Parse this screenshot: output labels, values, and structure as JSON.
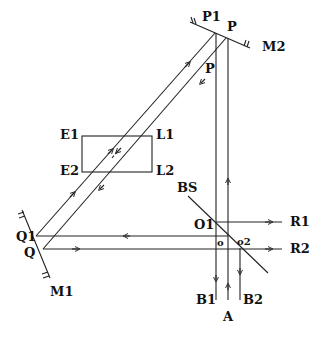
{
  "diagram": {
    "type": "optical interferometer setup",
    "labels": {
      "P1": "P1",
      "P_top": "P",
      "P_mid": "P",
      "M2": "M2",
      "E1": "E1",
      "E2": "E2",
      "L1": "L1",
      "L2": "L2",
      "BS": "BS",
      "O1": "O1",
      "O": "o",
      "O2": "o2",
      "R1": "R1",
      "R2": "R2",
      "Q1": "Q1",
      "Q": "Q",
      "M1": "M1",
      "B1": "B1",
      "A": "A",
      "B2": "B2"
    },
    "components": [
      "Mirror M1",
      "Mirror M2",
      "Beam splitter BS",
      "Sample cell E1-L1-E2-L2"
    ],
    "colors": {
      "line": "#222222",
      "background": "#ffffff"
    }
  }
}
